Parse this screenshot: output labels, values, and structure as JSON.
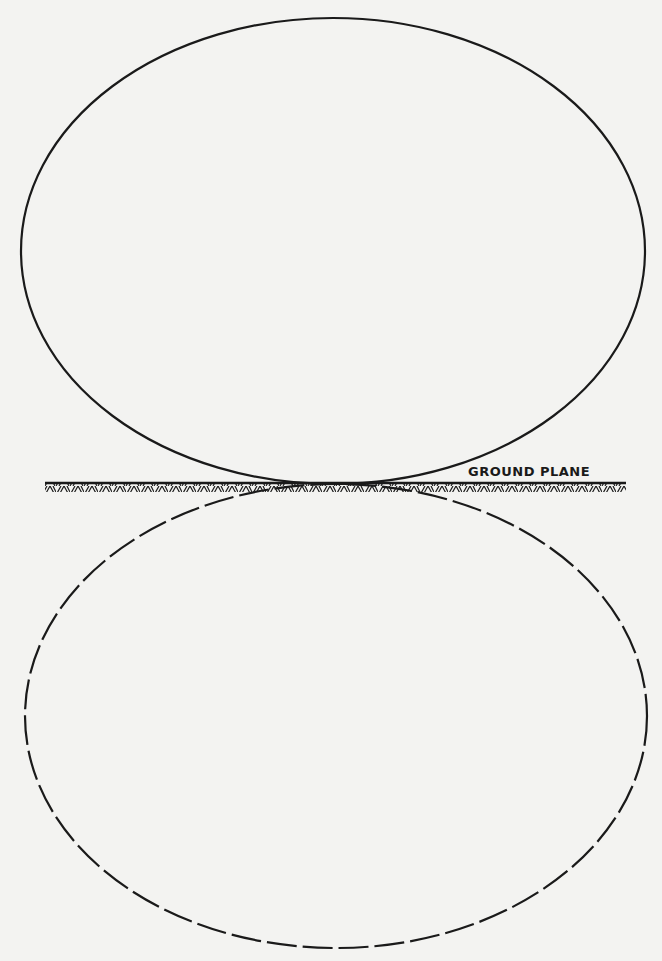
{
  "diagram": {
    "type": "radiation-pattern",
    "labels": {
      "ground_plane": "GROUND PLANE"
    },
    "elements": [
      {
        "name": "upper-lobe",
        "style": "solid",
        "description": "Radiation lobe above the ground plane"
      },
      {
        "name": "lower-lobe-image",
        "style": "dashed",
        "description": "Image lobe below the ground plane"
      },
      {
        "name": "ground-plane",
        "style": "hatched-line"
      }
    ],
    "colors": {
      "background": "#f3f3f1",
      "ink": "#1a1a1a"
    }
  }
}
